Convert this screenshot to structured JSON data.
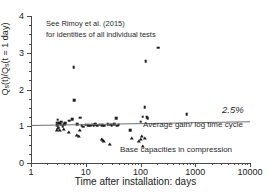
{
  "chart_data": {
    "type": "scatter",
    "title": "",
    "xlabel": "Time after installation: days",
    "ylabel": "Qs(t)/Qs(t = 1 day)",
    "ylabel_parts": {
      "pre": "Q",
      "sub1": "s",
      "mid": "(t)/Q",
      "sub2": "s",
      "post": "(t = 1 day)"
    },
    "xscale": "log",
    "yscale": "linear",
    "xlim": [
      1,
      10000
    ],
    "ylim": [
      0,
      4
    ],
    "xticks": [
      1,
      10,
      100,
      1000,
      10000
    ],
    "xticklabels": [
      "1",
      "10",
      "100",
      "1000",
      "10000"
    ],
    "yticks": [
      0,
      1,
      2,
      3,
      4
    ],
    "yticklabels": [
      "0",
      "1",
      "2",
      "3",
      "4"
    ],
    "grid": false,
    "legend": "none",
    "annotations": [
      {
        "name": "reference-note",
        "text_line1": "See Rimoy et al. (2015)",
        "text_line2": "for identities of all individual tests"
      },
      {
        "name": "trend-percent-label",
        "text": "2.5%"
      },
      {
        "name": "average-gain-label",
        "text": "Average gain/ log time cycle"
      },
      {
        "name": "base-capacities-label",
        "text": "Base capacities in compression"
      }
    ],
    "trend_line": {
      "name": "average-gain-trend",
      "x_start": 1,
      "x_end": 10000,
      "y_start": 1.04,
      "y_end": 1.14,
      "gain_per_log_cycle_percent": 2.5,
      "color": "#6f6f6f"
    },
    "series": [
      {
        "name": "shaft-capacity-square",
        "marker": "square",
        "color": "#1c1c1c",
        "points": [
          [
            3.0,
            1.1
          ],
          [
            3.0,
            1.03
          ],
          [
            3.1,
            1.18
          ],
          [
            3.2,
            0.96
          ],
          [
            3.3,
            1.08
          ],
          [
            3.5,
            1.05
          ],
          [
            3.6,
            1.12
          ],
          [
            3.8,
            1.0
          ],
          [
            4.0,
            1.06
          ],
          [
            4.2,
            1.09
          ],
          [
            5.0,
            1.15
          ],
          [
            5.6,
            1.19
          ],
          [
            6.0,
            2.6
          ],
          [
            6.2,
            1.71
          ],
          [
            7.0,
            1.05
          ],
          [
            8.0,
            1.23
          ],
          [
            8.5,
            1.02
          ],
          [
            9.0,
            0.99
          ],
          [
            10.0,
            1.04
          ],
          [
            11.0,
            1.03
          ],
          [
            12.0,
            1.02
          ],
          [
            13.0,
            1.04
          ],
          [
            14.0,
            1.03
          ],
          [
            15.0,
            1.05
          ],
          [
            16.0,
            1.02
          ],
          [
            18.0,
            1.04
          ],
          [
            20.0,
            1.03
          ],
          [
            22.0,
            1.02
          ],
          [
            25.0,
            1.05
          ],
          [
            28.0,
            1.04
          ],
          [
            30.0,
            1.03
          ],
          [
            33.0,
            1.06
          ],
          [
            36.0,
            1.22
          ],
          [
            38.0,
            1.02
          ],
          [
            40.0,
            1.04
          ],
          [
            65.0,
            0.9
          ],
          [
            100.0,
            1.12
          ],
          [
            110.0,
            1.26
          ],
          [
            120.0,
            1.52
          ],
          [
            125.0,
            2.77
          ],
          [
            130.0,
            1.24
          ],
          [
            135.0,
            1.22
          ],
          [
            210.0,
            3.14
          ],
          [
            700.0,
            1.33
          ]
        ]
      },
      {
        "name": "base-capacity-triangle",
        "marker": "triangle",
        "color": "#1c1c1c",
        "points": [
          [
            3.0,
            0.88
          ],
          [
            3.1,
            0.92
          ],
          [
            3.4,
            0.86
          ],
          [
            4.0,
            0.91
          ],
          [
            5.0,
            0.82
          ],
          [
            7.0,
            0.73
          ],
          [
            7.5,
            0.7
          ],
          [
            8.0,
            0.88
          ],
          [
            20.0,
            0.62
          ],
          [
            21.0,
            0.6
          ],
          [
            22.0,
            0.57
          ],
          [
            28.0,
            0.49
          ],
          [
            70.0,
            0.64
          ],
          [
            95.0,
            0.56
          ],
          [
            100.0,
            0.62
          ],
          [
            105.0,
            0.7
          ],
          [
            110.0,
            0.44
          ],
          [
            120.0,
            0.66
          ]
        ]
      }
    ]
  }
}
